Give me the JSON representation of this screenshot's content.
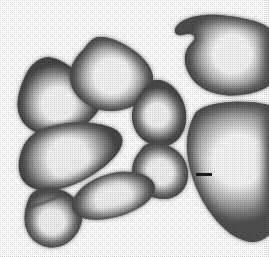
{
  "figure": {
    "title": "Carpal bone cluster",
    "description": "Grayscale halftone photographic plate of eight disarticulated carpal bones arranged in a cluster on a white background",
    "background_color": "#ffffff",
    "ink_color": "#1b1b1b",
    "render_style": "halftone",
    "canvas": {
      "width": 269,
      "height": 257
    }
  },
  "scale_bar": {
    "name": "scale-bar",
    "label": "",
    "color": "#1b1b1b",
    "x": 196,
    "y": 173,
    "width": 16,
    "height": 3
  },
  "specimens": [
    {
      "id": "bone-upper-left",
      "label": "upper left bone",
      "position": "upper-left",
      "edge_color": "#474747",
      "mid_color": "#9b9b9b",
      "core_color": "#f2f2f2",
      "path": "M 26 74 C 20 87 15 102 19 114 C 23 127 35 134 48 135 C 62 136 76 131 88 122 C 98 114 103 104 101 96 C 99 88 91 83 84 77 C 74 69 64 61 53 58 C 42 55 32 63 26 74 Z",
      "highlight": {
        "cx": 58,
        "cy": 104,
        "rx": 26,
        "ry": 17
      }
    },
    {
      "id": "bone-upper-middle",
      "label": "upper middle bone",
      "position": "upper-middle",
      "edge_color": "#4b4b4b",
      "mid_color": "#9e9e9e",
      "core_color": "#f3f3f3",
      "path": "M 83 50 C 74 58 69 69 70 79 C 71 91 80 101 92 107 C 105 113 120 112 133 106 C 145 100 153 89 153 79 C 153 69 146 60 136 52 C 124 43 110 36 99 37 C 91 38 88 44 83 50 Z",
      "highlight": {
        "cx": 112,
        "cy": 76,
        "rx": 28,
        "ry": 16
      }
    },
    {
      "id": "bone-center",
      "label": "center bone",
      "position": "center",
      "edge_color": "#4a4a4a",
      "mid_color": "#9c9c9c",
      "core_color": "#f0f0f0",
      "path": "M 142 92 C 134 101 130 113 133 124 C 136 136 146 144 157 146 C 168 148 178 142 183 132 C 188 121 187 108 181 97 C 175 86 165 79 156 80 C 149 81 146 86 142 92 Z",
      "highlight": {
        "cx": 157,
        "cy": 115,
        "rx": 18,
        "ry": 15
      }
    },
    {
      "id": "bone-center-lower",
      "label": "center lower bone",
      "position": "center-right-lower",
      "edge_color": "#4c4c4c",
      "mid_color": "#9d9d9d",
      "core_color": "#efefef",
      "path": "M 140 151 C 133 159 130 170 134 180 C 139 192 152 199 164 199 C 175 199 184 192 187 182 C 190 171 186 159 178 152 C 169 144 157 141 148 144 C 144 145 142 148 140 151 Z",
      "highlight": {
        "cx": 160,
        "cy": 172,
        "rx": 20,
        "ry": 14
      }
    },
    {
      "id": "bone-mid-left",
      "label": "mid left bone",
      "position": "mid-left",
      "edge_color": "#464646",
      "mid_color": "#979797",
      "core_color": "#f1f1f1",
      "path": "M 24 145 C 18 157 17 170 22 179 C 28 189 41 192 55 190 C 72 187 90 178 105 166 C 117 156 124 146 122 138 C 120 130 110 126 98 124 C 80 121 60 123 45 128 C 34 132 28 138 24 145 Z",
      "highlight": {
        "cx": 68,
        "cy": 158,
        "rx": 32,
        "ry": 17
      }
    },
    {
      "id": "bone-lower-left-small",
      "label": "lower left small bone",
      "position": "lower-left",
      "edge_color": "#4d4d4d",
      "mid_color": "#9a9a9a",
      "core_color": "#efefef",
      "path": "M 30 196 C 25 206 23 218 26 228 C 29 238 37 245 47 247 C 57 249 67 245 74 237 C 81 229 84 218 81 209 C 78 199 69 192 58 189 C 47 186 35 188 30 196 Z",
      "highlight": {
        "cx": 52,
        "cy": 222,
        "rx": 20,
        "ry": 15
      },
      "suture_path": "M 28 208 C 40 204 55 199 68 192"
    },
    {
      "id": "bone-lower-middle",
      "label": "lower middle bone",
      "position": "lower-middle",
      "edge_color": "#4a4a4a",
      "mid_color": "#9c9c9c",
      "core_color": "#f0f0f0",
      "path": "M 80 190 C 73 197 70 206 74 212 C 79 219 92 221 106 219 C 121 217 136 211 146 203 C 154 196 157 188 153 182 C 148 174 134 171 119 172 C 103 174 88 181 80 190 Z",
      "highlight": {
        "cx": 114,
        "cy": 199,
        "rx": 28,
        "ry": 13
      }
    },
    {
      "id": "bone-upper-right-hooked",
      "label": "upper right hooked bone",
      "position": "upper-right",
      "edge_color": "#4e4e4e",
      "mid_color": "#a0a0a0",
      "core_color": "#f4f4f4",
      "path": "M 181 22 C 190 16 204 14 220 15 C 243 17 262 22 269 28 L 269 86 C 258 93 240 97 224 95 C 207 93 195 85 189 74 C 183 63 184 52 189 46 C 193 41 196 39 194 36 C 192 33 186 34 182 35 C 177 36 174 33 175 29 C 176 26 178 24 181 22 Z",
      "highlight": {
        "cx": 232,
        "cy": 54,
        "rx": 30,
        "ry": 22
      }
    },
    {
      "id": "bone-right-large",
      "label": "large right bone",
      "position": "right",
      "edge_color": "#505050",
      "mid_color": "#a2a2a2",
      "core_color": "#f5f5f5",
      "path": "M 196 112 C 188 125 185 142 188 159 C 191 178 199 198 212 215 C 224 231 238 241 252 242 C 259 242 265 239 269 235 L 269 105 C 258 102 244 101 230 102 C 215 103 203 106 196 112 Z",
      "highlight": {
        "cx": 238,
        "cy": 160,
        "rx": 34,
        "ry": 40
      }
    }
  ]
}
